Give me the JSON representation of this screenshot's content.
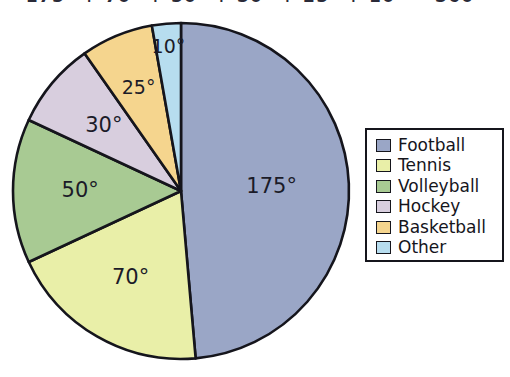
{
  "equation": {
    "text": "175° + 70° + 50° + 30° + 25° + 10° = 360°"
  },
  "legend": {
    "items": [
      {
        "label": "Football",
        "color": "#9aa6c6"
      },
      {
        "label": "Tennis",
        "color": "#e9efa8"
      },
      {
        "label": "Volleyball",
        "color": "#a8ca93"
      },
      {
        "label": "Hockey",
        "color": "#d8cede"
      },
      {
        "label": "Basketball",
        "color": "#f5d58e"
      },
      {
        "label": "Other",
        "color": "#b7ddef"
      }
    ]
  },
  "chart_data": {
    "type": "pie",
    "title": "",
    "unit": "degrees",
    "total": 360,
    "start_angle_deg": 0,
    "direction": "clockwise",
    "categories": [
      "Football",
      "Tennis",
      "Volleyball",
      "Hockey",
      "Basketball",
      "Other"
    ],
    "values": [
      175,
      70,
      50,
      30,
      25,
      10
    ],
    "labels": [
      "175°",
      "70°",
      "50°",
      "30°",
      "25°",
      "10°"
    ],
    "colors": [
      "#9aa6c6",
      "#e9efa8",
      "#a8ca93",
      "#d8cede",
      "#f5d58e",
      "#b7ddef"
    ],
    "legend_position": "right",
    "grid": false,
    "xlabel": "",
    "ylabel": ""
  }
}
